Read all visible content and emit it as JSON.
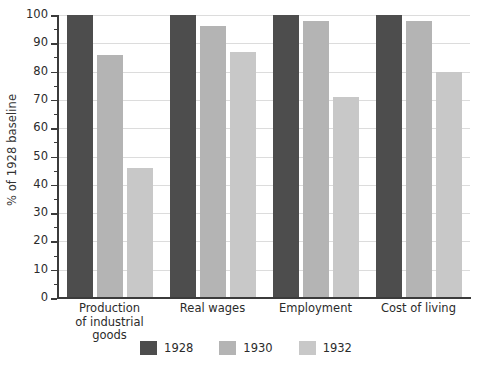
{
  "chart_data": {
    "type": "bar",
    "title": "",
    "subtitle": "",
    "xlabel": "",
    "ylabel": "% of 1928 baseline",
    "ylim": [
      0,
      100
    ],
    "ytick_step": 10,
    "yminor_step": 5,
    "grid": true,
    "legend_position": "bottom",
    "categories": [
      "Production\nof industrial\ngoods",
      "Real wages",
      "Employment",
      "Cost of living"
    ],
    "category_labels": [
      [
        "Production",
        "of industrial",
        "goods"
      ],
      [
        "Real wages"
      ],
      [
        "Employment"
      ],
      [
        "Cost of living"
      ]
    ],
    "ytick_labels": [
      "0",
      "10",
      "20",
      "30",
      "40",
      "50",
      "60",
      "70",
      "80",
      "90",
      "100"
    ],
    "ytick_values": [
      0,
      10,
      20,
      30,
      40,
      50,
      60,
      70,
      80,
      90,
      100
    ],
    "series": [
      {
        "name": "1928",
        "color": "#4d4d4d",
        "values": [
          100,
          100,
          100,
          100
        ]
      },
      {
        "name": "1930",
        "color": "#b4b4b4",
        "values": [
          86,
          96,
          98,
          98
        ]
      },
      {
        "name": "1932",
        "color": "#c8c8c8",
        "values": [
          46,
          87,
          71,
          80
        ]
      }
    ]
  },
  "legend": {
    "items": [
      {
        "label": "1928",
        "color": "#4d4d4d"
      },
      {
        "label": "1930",
        "color": "#b4b4b4"
      },
      {
        "label": "1932",
        "color": "#c8c8c8"
      }
    ]
  },
  "colors": {
    "background": "#ffffff",
    "axis": "#3b3b3b",
    "gridline": "#e0e0e0",
    "text": "#2b2b2b",
    "series_1928": "#4d4d4d",
    "series_1930": "#b4b4b4",
    "series_1932": "#c8c8c8"
  }
}
